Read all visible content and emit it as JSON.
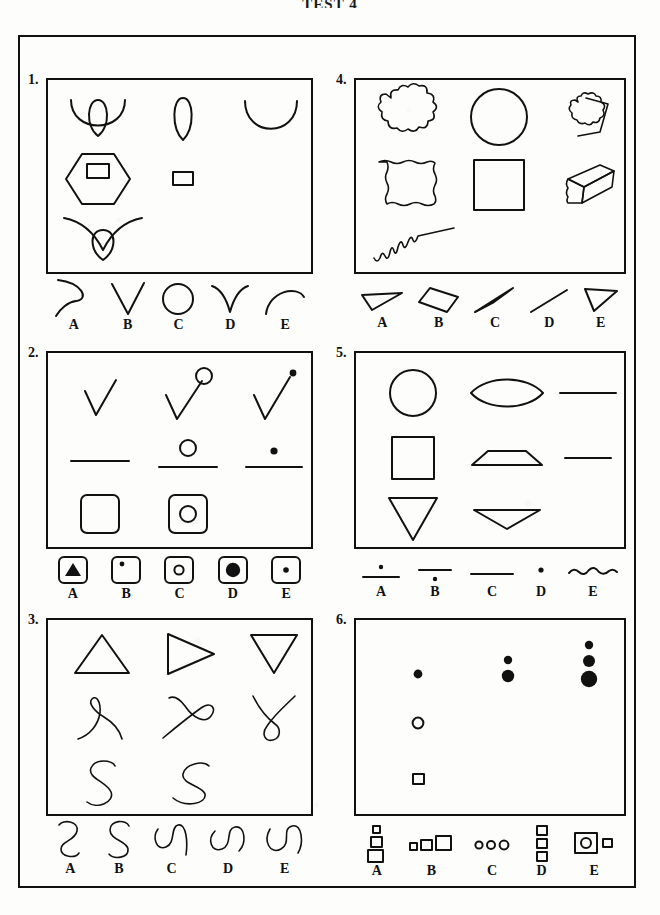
{
  "document": {
    "title": "TEST 4",
    "type": "visual-reasoning-worksheet",
    "panel_count": 6,
    "option_letters": [
      "A",
      "B",
      "C",
      "D",
      "E"
    ]
  },
  "panels": [
    {
      "number": "1.",
      "position": "top-left",
      "stimulus_items": [
        "arc-with-teardrop-loop",
        "teardrop-loop",
        "open-arc-u",
        "hexagon-with-small-rectangle",
        "small-rectangle",
        "",
        "wide-arc-with-teardrop",
        "",
        ""
      ],
      "options": [
        {
          "letter": "A",
          "shape": "right-curving-arc"
        },
        {
          "letter": "B",
          "shape": "v-shape"
        },
        {
          "letter": "C",
          "shape": "circle"
        },
        {
          "letter": "D",
          "shape": "inverted-v-curve"
        },
        {
          "letter": "E",
          "shape": "arch-curve"
        }
      ]
    },
    {
      "number": "2.",
      "position": "middle-left",
      "stimulus_items": [
        "checkmark",
        "checkmark-with-open-circle",
        "checkmark-with-dot",
        "horizontal-line",
        "horizontal-line-with-open-circle",
        "horizontal-line-with-dot",
        "rounded-square",
        "rounded-square-with-open-circle",
        ""
      ],
      "options": [
        {
          "letter": "A",
          "shape": "square-with-filled-triangle"
        },
        {
          "letter": "B",
          "shape": "square-with-corner-dot"
        },
        {
          "letter": "C",
          "shape": "square-with-open-circle"
        },
        {
          "letter": "D",
          "shape": "square-with-large-filled-circle"
        },
        {
          "letter": "E",
          "shape": "square-with-small-dot"
        }
      ]
    },
    {
      "number": "3.",
      "position": "bottom-left",
      "stimulus_items": [
        "triangle-up",
        "triangle-right",
        "triangle-down",
        "curve-loop-left",
        "curve-loop-right",
        "curve-loop-y",
        "letter-s-upright",
        "letter-s-tilted",
        ""
      ],
      "options": [
        {
          "letter": "A",
          "shape": "s-curve-narrow"
        },
        {
          "letter": "B",
          "shape": "s-curve-standard"
        },
        {
          "letter": "C",
          "shape": "s-curve-rotated-tail"
        },
        {
          "letter": "D",
          "shape": "s-curve-rotated-90"
        },
        {
          "letter": "E",
          "shape": "s-curve-rotated-wide"
        }
      ]
    },
    {
      "number": "4.",
      "position": "top-right",
      "stimulus_items": [
        "cloud-scalloped-blob",
        "circle",
        "cylinder-scalloped-end",
        "wavy-edged-square",
        "square",
        "box-3d-wavy-edge",
        "zigzag-line-rising",
        "",
        ""
      ],
      "options": [
        {
          "letter": "A",
          "shape": "thin-flat-triangle"
        },
        {
          "letter": "B",
          "shape": "slanted-rectangle"
        },
        {
          "letter": "C",
          "shape": "thin-sliver-triangle"
        },
        {
          "letter": "D",
          "shape": "diagonal-line"
        },
        {
          "letter": "E",
          "shape": "triangle-outline-right"
        }
      ]
    },
    {
      "number": "5.",
      "position": "middle-right",
      "stimulus_items": [
        "circle",
        "lens-ellipse",
        "horizontal-line",
        "square",
        "flattened-trapezoid",
        "horizontal-line-short",
        "triangle-down",
        "flattened-triangle-down",
        ""
      ],
      "options": [
        {
          "letter": "A",
          "shape": "line-with-dot-above"
        },
        {
          "letter": "B",
          "shape": "line-with-dot-below"
        },
        {
          "letter": "C",
          "shape": "thick-line"
        },
        {
          "letter": "D",
          "shape": "single-dot"
        },
        {
          "letter": "E",
          "shape": "wavy-line"
        }
      ]
    },
    {
      "number": "6.",
      "position": "bottom-right",
      "stimulus_items": [
        "single-filled-dot",
        "two-filled-dots-graded",
        "three-filled-dots-graded",
        "single-open-circle",
        "",
        "",
        "single-small-square",
        "",
        ""
      ],
      "options": [
        {
          "letter": "A",
          "shape": "three-squares-vertical-increasing"
        },
        {
          "letter": "B",
          "shape": "three-squares-horizontal-increasing"
        },
        {
          "letter": "C",
          "shape": "three-small-circles-horizontal"
        },
        {
          "letter": "D",
          "shape": "three-equal-squares-vertical"
        },
        {
          "letter": "E",
          "shape": "large-square-with-circle-and-small-square"
        }
      ]
    }
  ],
  "colors": {
    "ink": "#111111",
    "paper": "#fdfdfb"
  }
}
